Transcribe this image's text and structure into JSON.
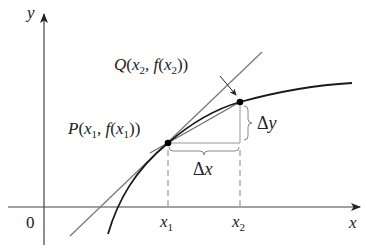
{
  "diagram": {
    "axes": {
      "x_label": "x",
      "y_label": "y",
      "origin_label": "0"
    },
    "ticks": {
      "x1": "x",
      "x1_sub": "1",
      "x2": "x",
      "x2_sub": "2"
    },
    "points": {
      "P": {
        "name": "P",
        "text_open": "(",
        "x": "x",
        "x_sub": "1",
        "sep": ", ",
        "f": "f",
        "f_open": "(",
        "fx": "x",
        "fx_sub": "1",
        "close": "))"
      },
      "Q": {
        "name": "Q",
        "text_open": "(",
        "x": "x",
        "x_sub": "2",
        "sep": ", ",
        "f": "f",
        "f_open": "(",
        "fx": "x",
        "fx_sub": "2",
        "close": "))"
      }
    },
    "increments": {
      "delta_x": "Δx",
      "delta_x_symbol": "Δ",
      "delta_x_var": "x",
      "delta_y_symbol": "Δ",
      "delta_y_var": "y"
    },
    "colors": {
      "curve": "#1a1a1a",
      "tangent": "#7a7a7a",
      "secant": "#6e6e6e",
      "axes": "#444444",
      "dashes": "#888888",
      "braces": "#888888",
      "points": "#000000"
    }
  }
}
